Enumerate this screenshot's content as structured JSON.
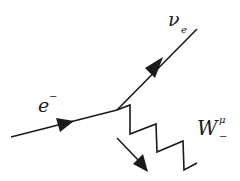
{
  "diagram": {
    "type": "feynman-diagram",
    "colors": {
      "line": "#1a1a1a",
      "background": "#ffffff"
    },
    "vertex": {
      "x": 117,
      "y": 110
    },
    "particles": {
      "electron": {
        "symbol": "e",
        "superscript": "−",
        "kind": "fermion-incoming"
      },
      "neutrino": {
        "symbol": "ν",
        "subscript": "e",
        "kind": "fermion-outgoing"
      },
      "w_boson": {
        "symbol": "W",
        "superscript": "μ",
        "subscript": "−",
        "kind": "boson-zigzag"
      }
    },
    "lines": {
      "electron": {
        "from": [
          11,
          137
        ],
        "to": [
          117,
          110
        ]
      },
      "neutrino": {
        "from": [
          117,
          110
        ],
        "to": [
          197,
          29
        ]
      },
      "w_zigzag": [
        [
          117,
          110
        ],
        [
          130,
          105
        ],
        [
          130,
          134
        ],
        [
          156,
          124
        ],
        [
          157,
          152
        ],
        [
          183,
          141
        ],
        [
          184,
          170
        ],
        [
          197,
          163
        ]
      ],
      "momentum_arrow": {
        "from": [
          117,
          138
        ],
        "to": [
          148,
          172
        ]
      }
    }
  }
}
